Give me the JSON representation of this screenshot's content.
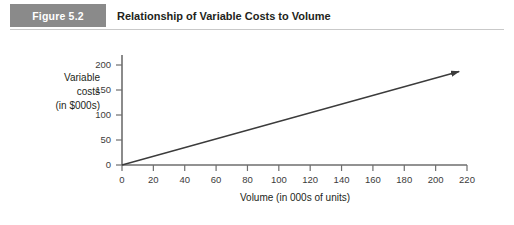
{
  "header": {
    "badge_label": "Figure 5.2",
    "title": "Relationship of Variable Costs to Volume",
    "badge_color": "#8a8a8a",
    "rule_color": "#c9c9c9"
  },
  "chart_data": {
    "type": "line",
    "title": "Relationship of Variable Costs to Volume",
    "xlabel": "Volume (in 000s of units)",
    "ylabel": "Variable costs (in $000s)",
    "ylabel_lines": [
      "Variable",
      "costs",
      "(in $000s)"
    ],
    "xlim": [
      0,
      220
    ],
    "ylim": [
      0,
      200
    ],
    "xticks": [
      0,
      20,
      40,
      60,
      80,
      100,
      120,
      140,
      160,
      180,
      200,
      220
    ],
    "yticks": [
      0,
      50,
      100,
      150,
      200
    ],
    "grid": false,
    "legend": false,
    "series": [
      {
        "name": "Variable costs",
        "x": [
          0,
          215
        ],
        "values": [
          0,
          187
        ],
        "arrow_end": true,
        "color": "#3b3b3b"
      }
    ],
    "annotations": []
  }
}
